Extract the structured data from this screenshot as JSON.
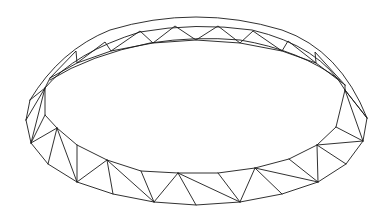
{
  "diagram": {
    "title": "Ring truss (tension/compression ring) line drawing",
    "line_color": "#1a1a1a",
    "background": "#ffffff",
    "outer_back_arc": "M 30 100 Q 60 50 110 30 Q 196 4 282 30 Q 340 50 367 118",
    "inner_back_arc": "M 45 88 Q 75 52 140 32 Q 196 22 252 30 Q 320 46 345 90",
    "back_inner_lower_arc": "M 50 80 Q 90 55 150 43 Q 196 36 240 40 Q 300 50 340 80",
    "front_bottom_nodes": [
      [
        26,
        120
      ],
      [
        31,
        143
      ],
      [
        48,
        164
      ],
      [
        77,
        182
      ],
      [
        113,
        194
      ],
      [
        154,
        202
      ],
      [
        196,
        205
      ],
      [
        240,
        202
      ],
      [
        282,
        194
      ],
      [
        318,
        182
      ],
      [
        346,
        164
      ],
      [
        363,
        141
      ],
      [
        367,
        118
      ]
    ],
    "front_top_nodes": [
      [
        45,
        88
      ],
      [
        45,
        115
      ],
      [
        57,
        128
      ],
      [
        77,
        145
      ],
      [
        107,
        160
      ],
      [
        141,
        171
      ],
      [
        178,
        173
      ],
      [
        218,
        173
      ],
      [
        255,
        168
      ],
      [
        289,
        159
      ],
      [
        317,
        145
      ],
      [
        336,
        127
      ],
      [
        345,
        90
      ]
    ],
    "back_top_nodes": [
      [
        76,
        51
      ],
      [
        105,
        42
      ],
      [
        140,
        31
      ],
      [
        175,
        26
      ],
      [
        218,
        26
      ],
      [
        253,
        31
      ],
      [
        288,
        41
      ],
      [
        315,
        52
      ]
    ],
    "back_bottom_nodes": [
      [
        50,
        78
      ],
      [
        77,
        63
      ],
      [
        111,
        51
      ],
      [
        153,
        43
      ],
      [
        196,
        40
      ],
      [
        240,
        43
      ],
      [
        282,
        51
      ],
      [
        316,
        63
      ],
      [
        345,
        85
      ]
    ]
  }
}
